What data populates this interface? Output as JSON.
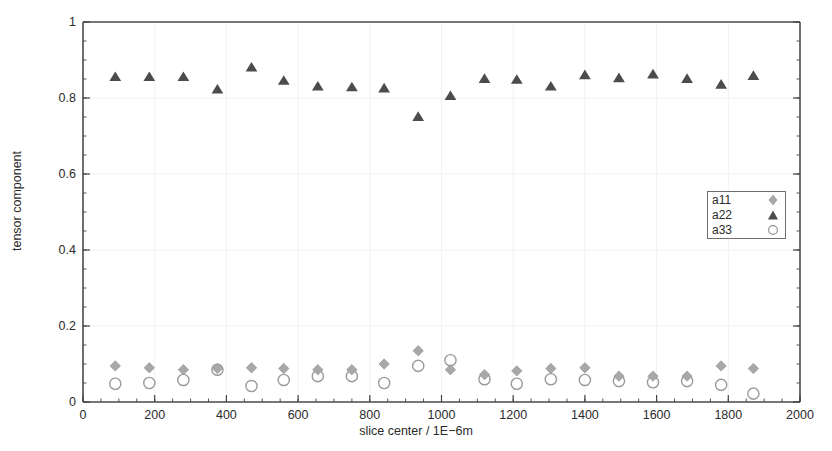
{
  "chart_data": {
    "type": "scatter",
    "title": "",
    "xlabel": "slice center / 1E−6m",
    "ylabel": "tensor component",
    "xlim": [
      0,
      2000
    ],
    "ylim": [
      0,
      1
    ],
    "xticks": [
      0,
      200,
      400,
      600,
      800,
      1000,
      1200,
      1400,
      1600,
      1800,
      2000
    ],
    "yticks": [
      0,
      0.2,
      0.4,
      0.6,
      0.8,
      1
    ],
    "xtick_labels": [
      "0",
      "200",
      "400",
      "600",
      "800",
      "1000",
      "1200",
      "1400",
      "1600",
      "1800",
      "2000"
    ],
    "ytick_labels": [
      "0",
      "0.2",
      "0.4",
      "0.6",
      "0.8",
      "1"
    ],
    "x_minor_tick_step": 50,
    "y_minor_tick_step": 0.05,
    "grid": true,
    "grid_style": "faint major gridlines",
    "legend_position": "right-middle-inside",
    "x": [
      90,
      185,
      280,
      375,
      470,
      560,
      655,
      750,
      840,
      935,
      1025,
      1120,
      1210,
      1305,
      1400,
      1495,
      1590,
      1685,
      1780,
      1870
    ],
    "series": [
      {
        "name": "a11",
        "marker": "diamond",
        "color": "#a8a8a8",
        "filled": true,
        "values": [
          0.095,
          0.09,
          0.085,
          0.088,
          0.09,
          0.088,
          0.085,
          0.085,
          0.1,
          0.135,
          0.085,
          0.072,
          0.082,
          0.088,
          0.09,
          0.068,
          0.068,
          0.068,
          0.095,
          0.088
        ]
      },
      {
        "name": "a22",
        "marker": "triangle",
        "color": "#4c4c4c",
        "filled": true,
        "values": [
          0.855,
          0.855,
          0.855,
          0.822,
          0.88,
          0.845,
          0.83,
          0.828,
          0.825,
          0.75,
          0.805,
          0.85,
          0.848,
          0.83,
          0.86,
          0.852,
          0.862,
          0.85,
          0.835,
          0.858
        ]
      },
      {
        "name": "a33",
        "marker": "circle",
        "color": "#9a9a9a",
        "filled": false,
        "values": [
          0.048,
          0.05,
          0.058,
          0.085,
          0.042,
          0.058,
          0.068,
          0.068,
          0.05,
          0.095,
          0.11,
          0.06,
          0.048,
          0.06,
          0.058,
          0.055,
          0.052,
          0.055,
          0.045,
          0.022
        ]
      }
    ]
  },
  "legend": {
    "items": [
      {
        "label": "a11",
        "marker": "diamond-marker"
      },
      {
        "label": "a22",
        "marker": "triangle-marker"
      },
      {
        "label": "a33",
        "marker": "circle-marker"
      }
    ]
  }
}
